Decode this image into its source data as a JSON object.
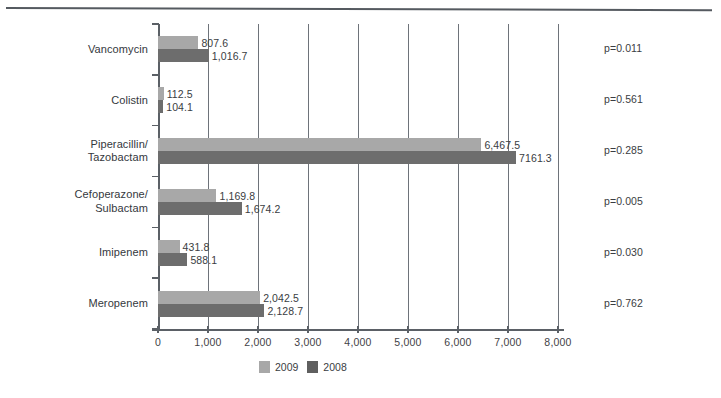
{
  "chart_data": {
    "type": "bar",
    "orientation": "horizontal",
    "title": "",
    "xlabel": "",
    "ylabel": "",
    "xlim": [
      0,
      8000
    ],
    "grid": true,
    "legend_position": "bottom",
    "categories": [
      "Vancomycin",
      "Colistin",
      "Piperacillin/\nTazobactam",
      "Cefoperazone/\nSulbactam",
      "Imipenem",
      "Meropenem"
    ],
    "category_lines": [
      [
        "Vancomycin"
      ],
      [
        "Colistin"
      ],
      [
        "Piperacillin/",
        "Tazobactam"
      ],
      [
        "Cefoperazone/",
        "Sulbactam"
      ],
      [
        "Imipenem"
      ],
      [
        "Meropenem"
      ]
    ],
    "series": [
      {
        "name": "2009",
        "color": "#a8a8a8",
        "values": [
          807.6,
          112.5,
          6467.5,
          1169.8,
          431.8,
          2042.5
        ],
        "labels": [
          "807.6",
          "112.5",
          "6,467.5",
          "1,169.8",
          "431.8",
          "2,042.5"
        ]
      },
      {
        "name": "2008",
        "color": "#6d6d6d",
        "values": [
          1016.7,
          104.1,
          7161.3,
          1674.2,
          588.1,
          2128.7
        ],
        "labels": [
          "1,016.7",
          "104.1",
          "7161.3",
          "1,674.2",
          "588.1",
          "2,128.7"
        ]
      }
    ],
    "xticks": [
      0,
      1000,
      2000,
      3000,
      4000,
      5000,
      6000,
      7000,
      8000
    ],
    "xticklabels": [
      "0",
      "1,000",
      "2,000",
      "3,000",
      "4,000",
      "5,000",
      "6,000",
      "7,000",
      "8,000"
    ],
    "annotations": {
      "p_values": [
        "p=0.011",
        "p=0.561",
        "p=0.285",
        "p=0.005",
        "p=0.030",
        "p=0.762"
      ]
    }
  },
  "legend": {
    "items": [
      {
        "label": "2009",
        "color": "#a8a8a8"
      },
      {
        "label": "2008",
        "color": "#5f5f5f"
      }
    ]
  }
}
